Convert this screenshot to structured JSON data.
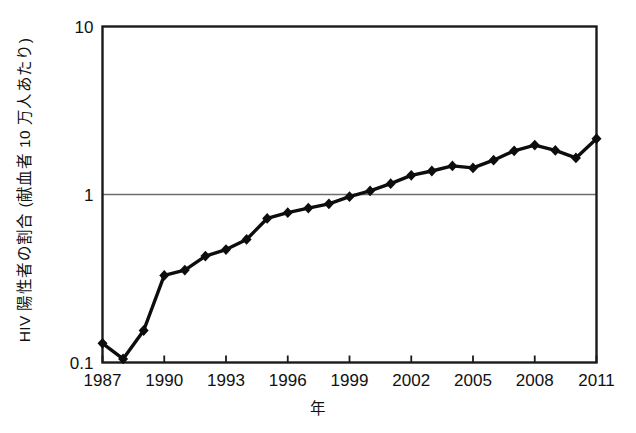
{
  "chart_data": {
    "type": "line",
    "title": "",
    "subtitle": "",
    "xlabel": "年",
    "ylabel": "HIV 陽性者の割合 (献血者 10 万人あたり)",
    "yscale": "log",
    "ylim": [
      0.1,
      10
    ],
    "xlim": [
      1987,
      2011
    ],
    "grid": "horizontal-at-1",
    "legend": null,
    "marker": "diamond",
    "line_color": "#000000",
    "marker_color": "#000000",
    "ytick_labels": [
      "10",
      "1",
      "0.1"
    ],
    "ytick_values": [
      10,
      1,
      0.1
    ],
    "xtick_labels": [
      "1987",
      "1990",
      "1993",
      "1996",
      "1999",
      "2002",
      "2005",
      "2008",
      "2011"
    ],
    "xtick_values": [
      1987,
      1990,
      1993,
      1996,
      1999,
      2002,
      2005,
      2008,
      2011
    ],
    "x": [
      1987,
      1988,
      1989,
      1990,
      1991,
      1992,
      1993,
      1994,
      1995,
      1996,
      1997,
      1998,
      1999,
      2000,
      2001,
      2002,
      2003,
      2004,
      2005,
      2006,
      2007,
      2008,
      2009,
      2010,
      2011
    ],
    "values": [
      0.13,
      0.105,
      0.155,
      0.33,
      0.355,
      0.43,
      0.47,
      0.54,
      0.72,
      0.78,
      0.83,
      0.88,
      0.97,
      1.05,
      1.16,
      1.3,
      1.38,
      1.48,
      1.44,
      1.6,
      1.82,
      1.97,
      1.83,
      1.65,
      2.15
    ],
    "series": [
      {
        "name": "HIV陽性者の割合",
        "values": [
          0.13,
          0.105,
          0.155,
          0.33,
          0.355,
          0.43,
          0.47,
          0.54,
          0.72,
          0.78,
          0.83,
          0.88,
          0.97,
          1.05,
          1.16,
          1.3,
          1.38,
          1.48,
          1.44,
          1.6,
          1.82,
          1.97,
          1.83,
          1.65,
          2.15
        ]
      }
    ]
  }
}
